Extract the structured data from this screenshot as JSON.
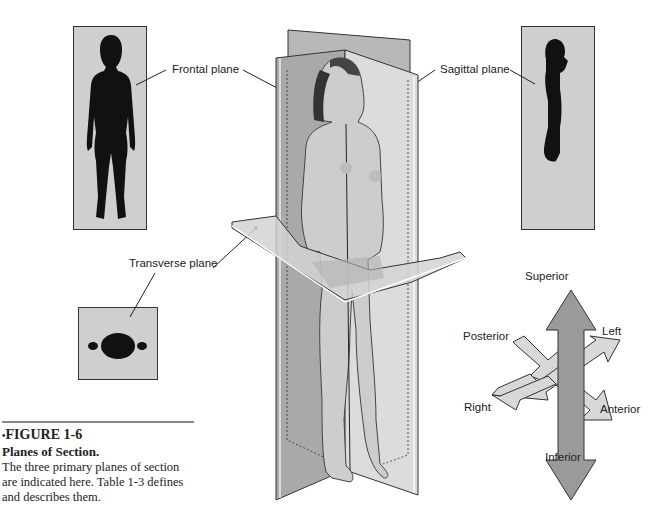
{
  "figure": {
    "number_label": "FIGURE 1-6",
    "bullet": "•",
    "title": "Planes of Section.",
    "description": "The three primary planes of section are indicated here. Table 1-3 defines and describes them."
  },
  "planes": {
    "frontal": {
      "label": "Frontal plane"
    },
    "sagittal": {
      "label": "Sagittal plane"
    },
    "transverse": {
      "label": "Transverse plane"
    }
  },
  "directions": {
    "superior": "Superior",
    "inferior": "Inferior",
    "left": "Left",
    "right": "Right",
    "anterior": "Anterior",
    "posterior": "Posterior"
  },
  "colors": {
    "panel_gray": "#cfcfcf",
    "silhouette": "#111111",
    "plane_dark": "#a9a9a9",
    "plane_light": "#dcdcdc",
    "arrow_dark": "#9a9a9a",
    "arrow_light": "#d8d8d8",
    "skin": "#cdcdcd"
  }
}
